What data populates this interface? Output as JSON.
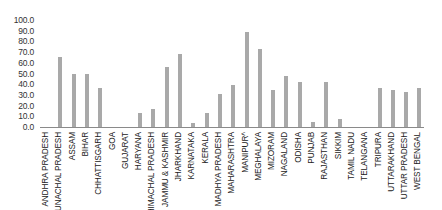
{
  "chart_data": {
    "type": "bar",
    "title": "",
    "xlabel": "",
    "ylabel": "",
    "ylim": [
      0,
      100
    ],
    "yticks": [
      "100.0",
      "90.0",
      "80.0",
      "70.0",
      "60.0",
      "50.0",
      "40.0",
      "30.0",
      "20.0",
      "10.0",
      "0.0"
    ],
    "grid": false,
    "legend": null,
    "bar_color": "#a9a9a9",
    "categories": [
      "ANDHRA PRADESH",
      "ARUNACHAL PRADESH",
      "ASSAM",
      "BIHAR",
      "CHHATTISGARH",
      "GOA",
      "GUJARAT",
      "HARYANA",
      "HIMACHAL PRADESH",
      "JAMMU & KASHMIR",
      "JHARKHAND",
      "KARNATAKA",
      "KERALA",
      "MADHYA PRADESH",
      "MAHARASHTRA",
      "MANIPUR^",
      "MEGHALAYA",
      "MIZORAM",
      "NAGALAND",
      "ODISHA",
      "PUNJAB",
      "RAJASTHAN",
      "SIKKIM",
      "TAMIL NADU",
      "TELANGANA",
      "TRIPURA",
      "UTTARAKHAND",
      "UTTAR PRADESH",
      "WEST BENGAL"
    ],
    "values": [
      0,
      65,
      49.5,
      50,
      36,
      0,
      0,
      13,
      17,
      56.5,
      68.5,
      3.5,
      13,
      31,
      39.5,
      89,
      73,
      34.5,
      47.5,
      42,
      4.5,
      42,
      7.5,
      0,
      0,
      36.5,
      34.5,
      32.5,
      36
    ]
  }
}
